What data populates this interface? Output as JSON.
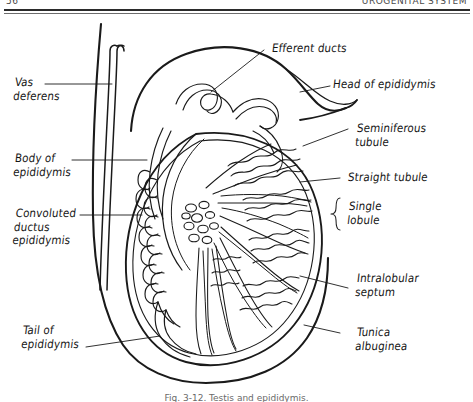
{
  "page": {
    "header_left": "56",
    "header_right": "UROGENITAL SYSTEM",
    "footer_caption": "Fig. 3-12. Testis and epididymis."
  },
  "figure": {
    "ink_color": "#1a1a1a",
    "background": "#ffffff"
  },
  "labels": {
    "left": [
      {
        "id": "vas-deferens",
        "text": "Vas\ndeferens"
      },
      {
        "id": "body-of-epididymis",
        "text": "Body of\nepididymis"
      },
      {
        "id": "convoluted-ductus-epididymis",
        "text": "Convoluted\nductus\nepididymis"
      },
      {
        "id": "tail-of-epididymis",
        "text": "Tail of\nepididymis"
      }
    ],
    "right": [
      {
        "id": "efferent-ducts",
        "text": "Efferent ducts"
      },
      {
        "id": "head-of-epididymis",
        "text": "Head of epididymis"
      },
      {
        "id": "seminiferous-tubule",
        "text": "Seminiferous\ntubule"
      },
      {
        "id": "straight-tubule",
        "text": "Straight tubule"
      },
      {
        "id": "single-lobule",
        "text": "Single\nlobule"
      },
      {
        "id": "intralobular-septum",
        "text": "Intralobular\nseptum"
      },
      {
        "id": "tunica-albuginea",
        "text": "Tunica\nalbuginea"
      }
    ]
  }
}
